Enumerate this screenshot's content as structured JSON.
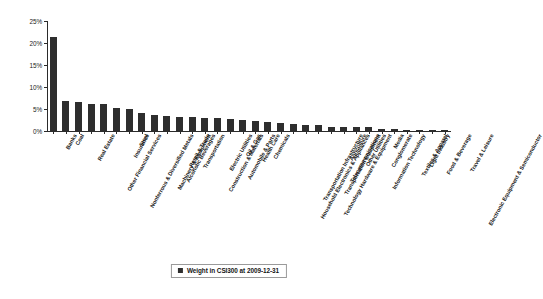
{
  "chart_data": {
    "type": "bar",
    "title": "",
    "subtitle": "",
    "xlabel": "",
    "ylabel": "",
    "ylim": [
      0,
      25
    ],
    "ytick_labels": [
      "0%",
      "5%",
      "10%",
      "15%",
      "20%",
      "25%"
    ],
    "ytick_values": [
      0,
      5,
      10,
      15,
      20,
      25
    ],
    "grid": false,
    "legend_position": "bottom-center",
    "legend_entries": [
      "Weight in CSI300 at 2009-12-31"
    ],
    "series_name": "Weight in CSI300 at 2009-12-31",
    "bar_color": "#2e2e2e",
    "categories": [
      "Banks",
      "Coal",
      "Real Estate",
      "Other Financial Services",
      "Nonferrous & Diversified Metals",
      "Insurance",
      "Steel",
      "Machinery & Equipment",
      "Alcoholic Beverages",
      "Retail & Trade",
      "Transportation",
      "Construction & Materials",
      "Electric Utilities",
      "Automobile & Parts",
      "Oil & Gas",
      "Health Care",
      "Chemicals",
      "Household Electronics & Appliances",
      "Transportation Infrastructure",
      "Technology Hardware & Equipment",
      "Transportation Equipment",
      "Telecommunications",
      "Agriculture",
      "Other Utilities",
      "Information Technology",
      "Conglomerate",
      "Media",
      "Textiles & Apparel",
      "Light Industry",
      "Food & Beverage",
      "Electronic Equipment & Semiconductor",
      "Travel & Leisure"
    ],
    "values": [
      21.3,
      6.9,
      6.7,
      6.1,
      6.2,
      5.2,
      5.0,
      4.2,
      3.6,
      3.4,
      3.2,
      3.1,
      3.0,
      3.0,
      2.7,
      2.5,
      2.2,
      2.0,
      1.8,
      1.5,
      1.3,
      1.3,
      0.8,
      0.8,
      0.8,
      0.8,
      0.4,
      0.4,
      0.3,
      0.3,
      0.25,
      0.2
    ],
    "value_unit": "%"
  },
  "legend": {
    "label": "Weight in CSI300 at 2009-12-31"
  }
}
